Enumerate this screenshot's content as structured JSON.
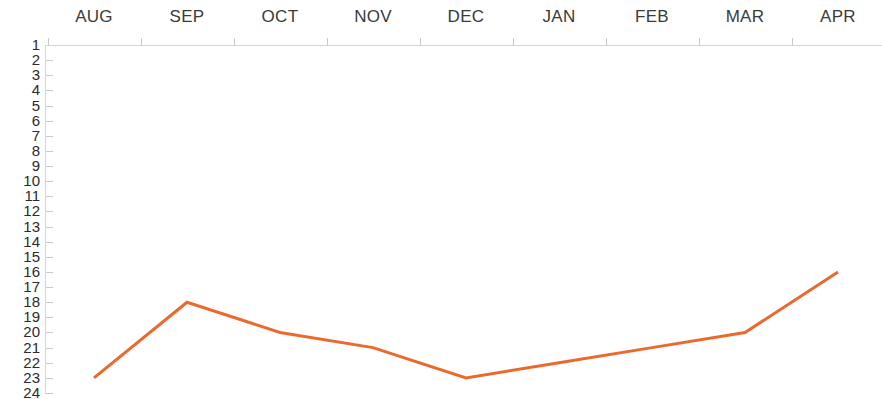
{
  "chart_data": {
    "type": "line",
    "title": "",
    "subtitle": "",
    "xlabel": "",
    "ylabel": "",
    "categories": [
      "AUG",
      "SEP",
      "OCT",
      "NOV",
      "DEC",
      "JAN",
      "FEB",
      "MAR",
      "APR"
    ],
    "values": [
      23,
      18,
      20,
      21,
      23,
      22,
      21,
      20,
      16
    ],
    "series": [
      {
        "name": "Rank",
        "values": [
          23,
          18,
          20,
          21,
          23,
          22,
          21,
          20,
          16
        ]
      }
    ],
    "ylim": [
      1,
      24
    ],
    "y_inverted": true,
    "y_tick_labels": [
      "1",
      "2",
      "3",
      "4",
      "5",
      "6",
      "7",
      "8",
      "9",
      "10",
      "11",
      "12",
      "13",
      "14",
      "15",
      "16",
      "17",
      "18",
      "19",
      "20",
      "21",
      "22",
      "23",
      "24"
    ],
    "x_tick_labels": [
      "AUG",
      "SEP",
      "OCT",
      "NOV",
      "DEC",
      "JAN",
      "FEB",
      "MAR",
      "APR"
    ],
    "grid": false,
    "legend": false,
    "legend_position": "none",
    "line_color": "#ea6a2e",
    "axis_color": "#d6d6d6",
    "tick_color": "#c9c9c9",
    "label_color": "#2b2b2b",
    "background_color": "#ffffff",
    "x_axis_position": "top",
    "markers": false,
    "line_width": 3
  },
  "axis": {
    "x_labels": [
      "AUG",
      "SEP",
      "OCT",
      "NOV",
      "DEC",
      "JAN",
      "FEB",
      "MAR",
      "APR"
    ],
    "y_labels": [
      "1",
      "2",
      "3",
      "4",
      "5",
      "6",
      "7",
      "8",
      "9",
      "10",
      "11",
      "12",
      "13",
      "14",
      "15",
      "16",
      "17",
      "18",
      "19",
      "20",
      "21",
      "22",
      "23",
      "24"
    ]
  }
}
